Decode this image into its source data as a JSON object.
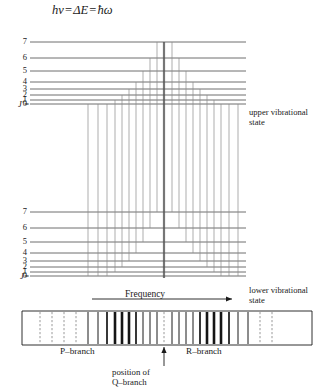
{
  "title": {
    "lhs": "hν",
    "eq1": "=",
    "mid": "ΔE",
    "eq2": "=",
    "rhs": "ħω"
  },
  "upper_state": {
    "axis_label": "J′=",
    "caption_line1": "upper vibrational",
    "caption_line2": "state",
    "levels": [
      {
        "j": "7",
        "y": 42
      },
      {
        "j": "6",
        "y": 58
      },
      {
        "j": "5",
        "y": 71
      },
      {
        "j": "4",
        "y": 82
      },
      {
        "j": "3",
        "y": 89
      },
      {
        "j": "2",
        "y": 95
      },
      {
        "j": "1",
        "y": 100
      },
      {
        "j": "0",
        "y": 104
      }
    ]
  },
  "lower_state": {
    "axis_label": "J=",
    "caption_line1": "lower vibrational",
    "caption_line2": "state",
    "levels": [
      {
        "j": "7",
        "y": 212
      },
      {
        "j": "6",
        "y": 228
      },
      {
        "j": "5",
        "y": 242
      },
      {
        "j": "4",
        "y": 253
      },
      {
        "j": "3",
        "y": 261
      },
      {
        "j": "2",
        "y": 267
      },
      {
        "j": "1",
        "y": 272
      },
      {
        "j": "0",
        "y": 276
      }
    ]
  },
  "frequency_axis": {
    "label": "Frequency",
    "arrow": "right-arrow"
  },
  "spectrum": {
    "p_branch_label": "P–branch",
    "r_branch_label": "R–branch",
    "q_caption_line1": "position of",
    "q_caption_line2": "Q–branch",
    "q_marker": "up-arrow",
    "box": {
      "x": 22,
      "y": 311,
      "width": 290,
      "height": 34
    },
    "lines": [
      {
        "x": 40,
        "weight": "dashed"
      },
      {
        "x": 52,
        "weight": "dashed"
      },
      {
        "x": 64,
        "weight": "dashed"
      },
      {
        "x": 76,
        "weight": "dashed"
      },
      {
        "x": 88,
        "weight": "thin"
      },
      {
        "x": 98,
        "weight": "thin"
      },
      {
        "x": 107,
        "weight": "medium"
      },
      {
        "x": 115,
        "weight": "bold"
      },
      {
        "x": 122,
        "weight": "bold"
      },
      {
        "x": 129,
        "weight": "bold"
      },
      {
        "x": 136,
        "weight": "medium"
      },
      {
        "x": 143,
        "weight": "thin"
      },
      {
        "x": 150,
        "weight": "thin"
      },
      {
        "x": 157,
        "weight": "thin"
      },
      {
        "x": 164,
        "weight": "dashed-q"
      },
      {
        "x": 172,
        "weight": "thin"
      },
      {
        "x": 179,
        "weight": "thin"
      },
      {
        "x": 186,
        "weight": "thin"
      },
      {
        "x": 193,
        "weight": "thin"
      },
      {
        "x": 200,
        "weight": "medium"
      },
      {
        "x": 207,
        "weight": "bold"
      },
      {
        "x": 214,
        "weight": "bold"
      },
      {
        "x": 221,
        "weight": "bold"
      },
      {
        "x": 229,
        "weight": "medium"
      },
      {
        "x": 238,
        "weight": "thin"
      },
      {
        "x": 248,
        "weight": "thin"
      },
      {
        "x": 260,
        "weight": "dashed"
      },
      {
        "x": 272,
        "weight": "dashed"
      }
    ]
  },
  "transitions": {
    "p_branch_x": [
      88,
      98,
      107,
      115,
      122,
      129,
      136,
      143,
      150,
      157
    ],
    "r_branch_x": [
      172,
      179,
      186,
      193,
      200,
      207,
      214,
      221,
      229,
      238
    ],
    "center_x": 164
  },
  "geometry": {
    "level_left_x": 30,
    "level_right_x": 246,
    "upper_band_top": 40,
    "lower_band_bottom": 278
  },
  "colors": {
    "ink": "#1a1a1a",
    "line": "#4a4a4a",
    "light_line": "#8a8a8a",
    "dashed": "#9a9a9a",
    "bold_line": "#151515"
  }
}
